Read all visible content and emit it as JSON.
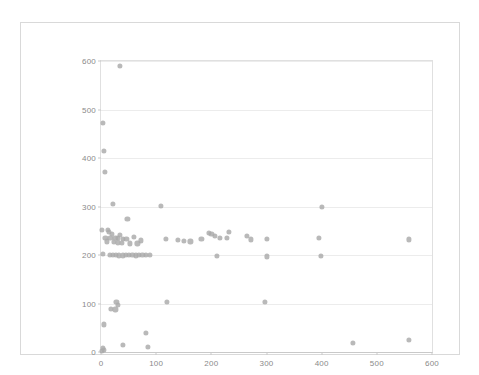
{
  "chart_data": {
    "type": "scatter",
    "title": "",
    "xlabel": "",
    "ylabel": "",
    "xlim": [
      0,
      600
    ],
    "ylim": [
      0,
      600
    ],
    "xticks": [
      0,
      100,
      200,
      300,
      400,
      500,
      600
    ],
    "yticks": [
      0,
      100,
      200,
      300,
      400,
      500,
      600
    ],
    "grid": "horizontal",
    "legend": "none",
    "marker_color": "#a9a9a9",
    "series": [
      {
        "name": "series-1",
        "points": [
          [
            35,
            590
          ],
          [
            3,
            473
          ],
          [
            6,
            414
          ],
          [
            7,
            371
          ],
          [
            22,
            305
          ],
          [
            108,
            302
          ],
          [
            400,
            300
          ],
          [
            48,
            274
          ],
          [
            2,
            252
          ],
          [
            13,
            251
          ],
          [
            14,
            248
          ],
          [
            232,
            247
          ],
          [
            20,
            243
          ],
          [
            35,
            241
          ],
          [
            60,
            238
          ],
          [
            8,
            236
          ],
          [
            17,
            236
          ],
          [
            26,
            236
          ],
          [
            31,
            235
          ],
          [
            40,
            234
          ],
          [
            46,
            233
          ],
          [
            118,
            233
          ],
          [
            196,
            245
          ],
          [
            200,
            243
          ],
          [
            206,
            239
          ],
          [
            215,
            236
          ],
          [
            228,
            235
          ],
          [
            182,
            234
          ],
          [
            265,
            240
          ],
          [
            272,
            232
          ],
          [
            300,
            234
          ],
          [
            395,
            235
          ],
          [
            558,
            232
          ],
          [
            10,
            228
          ],
          [
            23,
            227
          ],
          [
            30,
            226
          ],
          [
            38,
            225
          ],
          [
            52,
            224
          ],
          [
            66,
            224
          ],
          [
            72,
            230
          ],
          [
            140,
            231
          ],
          [
            150,
            229
          ],
          [
            162,
            228
          ],
          [
            4,
            203
          ],
          [
            16,
            201
          ],
          [
            21,
            200
          ],
          [
            27,
            200
          ],
          [
            33,
            199
          ],
          [
            39,
            199
          ],
          [
            45,
            200
          ],
          [
            51,
            201
          ],
          [
            57,
            200
          ],
          [
            63,
            199
          ],
          [
            69,
            200
          ],
          [
            75,
            201
          ],
          [
            81,
            200
          ],
          [
            88,
            200
          ],
          [
            210,
            198
          ],
          [
            300,
            197
          ],
          [
            398,
            198
          ],
          [
            28,
            104
          ],
          [
            30,
            97
          ],
          [
            120,
            103
          ],
          [
            297,
            103
          ],
          [
            18,
            89
          ],
          [
            26,
            88
          ],
          [
            5,
            57
          ],
          [
            82,
            40
          ],
          [
            3,
            8
          ],
          [
            5,
            5
          ],
          [
            2,
            3
          ],
          [
            40,
            14
          ],
          [
            85,
            10
          ],
          [
            457,
            18
          ],
          [
            558,
            25
          ]
        ]
      }
    ]
  },
  "axes": {
    "y_tick_labels": [
      "0",
      "100",
      "200",
      "300",
      "400",
      "500",
      "600"
    ],
    "x_tick_labels": [
      "0",
      "100",
      "200",
      "300",
      "400",
      "500",
      "600"
    ]
  }
}
